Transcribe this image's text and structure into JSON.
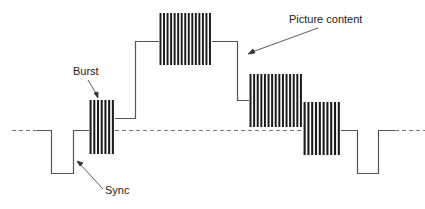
{
  "diagram": {
    "labels": {
      "burst": "Burst",
      "sync": "Sync",
      "picture": "Picture content"
    },
    "colors": {
      "line": "#555555",
      "bars": "#1a1a1a",
      "dash": "#777777",
      "text": "#222222"
    },
    "blanking_level_y": 130,
    "segments": [
      {
        "name": "sync-left",
        "x1": 51,
        "x2": 73,
        "y_bottom": 173
      },
      {
        "name": "burst",
        "x1": 89,
        "x2": 115,
        "y_top": 100,
        "y_bottom": 154,
        "bars": 7
      },
      {
        "name": "picture-block-1",
        "x1": 159,
        "x2": 212,
        "y_top": 13,
        "y_bottom": 65,
        "bars": 15
      },
      {
        "name": "picture-block-2",
        "x1": 249,
        "x2": 303,
        "y_top": 74,
        "y_bottom": 127,
        "bars": 15
      },
      {
        "name": "picture-block-3",
        "x1": 303,
        "x2": 341,
        "y_top": 102,
        "y_bottom": 155,
        "bars": 10
      },
      {
        "name": "sync-right",
        "x1": 357,
        "x2": 378,
        "y_bottom": 173
      }
    ]
  }
}
